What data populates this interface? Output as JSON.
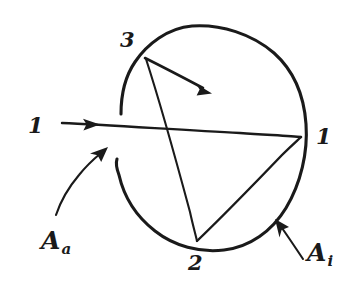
{
  "figure": {
    "kind": "hand-drawn-sketch",
    "background_color": "#ffffff",
    "ink_color": "#1a1a1a",
    "width": 364,
    "height": 297
  },
  "labels": {
    "node_3": "3",
    "node_2": "2",
    "node_1_right": "1",
    "flow_1_left": "1",
    "area_a": {
      "base": "A",
      "subscript": "a"
    },
    "area_i": {
      "base": "A",
      "subscript": "i"
    }
  },
  "icons": {
    "inflow_arrow": "arrow-right-icon",
    "interior_arrow": "arrow-down-right-icon",
    "leader_arrow_a": "arrow-up-right-icon",
    "leader_arrow_i": "arrow-up-left-icon"
  },
  "geometry": {
    "outer_curve": "irregular closed loop, open on the left side where the inflow arrow crosses",
    "triangle_vertices": [
      {
        "label": "3",
        "x": 145,
        "y": 58
      },
      {
        "label": "1",
        "x": 301,
        "y": 137
      },
      {
        "label": "2",
        "x": 197,
        "y": 241
      }
    ],
    "inflow_line": {
      "from_x": 62,
      "from_y": 124,
      "to_x": 301,
      "to_y": 137
    },
    "interior_arrow": {
      "from_x": 145,
      "from_y": 58,
      "to_x": 209,
      "to_y": 91
    },
    "leader_a": {
      "from_x": 56,
      "from_y": 214,
      "to_x": 104,
      "to_y": 151
    },
    "leader_i": {
      "from_x": 303,
      "from_y": 258,
      "to_x": 276,
      "to_y": 221
    }
  }
}
